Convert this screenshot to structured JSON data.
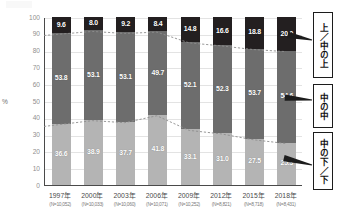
{
  "chart_data": {
    "type": "bar",
    "subtype": "stacked-bar-100pct-with-trendlines",
    "title": "",
    "xlabel": "",
    "ylabel": "%",
    "ylim": [
      0,
      100
    ],
    "yticks": [
      0,
      10,
      20,
      30,
      40,
      50,
      60,
      70,
      80,
      90,
      100
    ],
    "ytick_labels": [
      "0",
      "10",
      "20",
      "30",
      "40",
      "50",
      "60",
      "70",
      "80",
      "90",
      "100"
    ],
    "grid": true,
    "legend_position": "right",
    "categories": [
      "1997年",
      "2000年",
      "2003年",
      "2006年",
      "2009年",
      "2012年",
      "2015年",
      "2018年"
    ],
    "sample_sizes": [
      "(N=10,052)",
      "(N=10,033)",
      "(N=10,060)",
      "(N=10,071)",
      "(N=10,252)",
      "(N=8,821)",
      "(N=8,718)",
      "(N=8,431)"
    ],
    "series": [
      {
        "name": "上／中の上",
        "color": "#231f20",
        "values": [
          9.6,
          8.0,
          9.2,
          8.4,
          14.8,
          16.6,
          18.8,
          20.0
        ]
      },
      {
        "name": "中の中",
        "color": "#6d6d6d",
        "values": [
          53.8,
          53.1,
          53.1,
          49.7,
          52.1,
          52.3,
          53.7,
          54.6
        ]
      },
      {
        "name": "中の下／下",
        "color": "#b4b4b4",
        "values": [
          36.6,
          38.9,
          37.7,
          41.8,
          33.1,
          31.0,
          27.5,
          25.3
        ]
      }
    ],
    "trendlines": [
      {
        "name": "上段境界（上／中の上の下端）",
        "values": [
          90.4,
          92.0,
          90.8,
          91.6,
          85.2,
          83.4,
          81.2,
          80.0
        ]
      },
      {
        "name": "下段境界（中の下／下の上端）",
        "values": [
          36.6,
          38.9,
          37.7,
          41.8,
          33.1,
          31.0,
          27.5,
          25.3
        ]
      }
    ]
  },
  "axis": {
    "percent_symbol": "%"
  },
  "legend": {
    "items": [
      {
        "label": "上／中の上",
        "color": "#231f20"
      },
      {
        "label": "中の中",
        "color": "#6d6d6d"
      },
      {
        "label": "中の下／下",
        "color": "#b4b4b4"
      }
    ]
  }
}
